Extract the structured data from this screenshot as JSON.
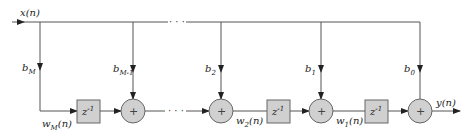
{
  "diagram": {
    "type": "transposed direct-form FIR filter structure",
    "input_label": "x(n)",
    "output_label": "y(n)",
    "delay_label": "z",
    "delay_exp": "-1",
    "adder_symbol": "+",
    "ellipsis": "· · ·",
    "coefficients": [
      {
        "base": "b",
        "sub": "M"
      },
      {
        "base": "b",
        "sub": "M-1"
      },
      {
        "base": "b",
        "sub": "2"
      },
      {
        "base": "b",
        "sub": "1"
      },
      {
        "base": "b",
        "sub": "0"
      }
    ],
    "states": [
      {
        "base": "w",
        "sub": "M",
        "arg": "(n)"
      },
      {
        "base": "w",
        "sub": "2",
        "arg": "(n)"
      },
      {
        "base": "w",
        "sub": "1",
        "arg": "(n)"
      }
    ],
    "colors": {
      "line": "#555555",
      "block_fill": "#d0d0d0",
      "block_stroke": "#666666"
    }
  }
}
